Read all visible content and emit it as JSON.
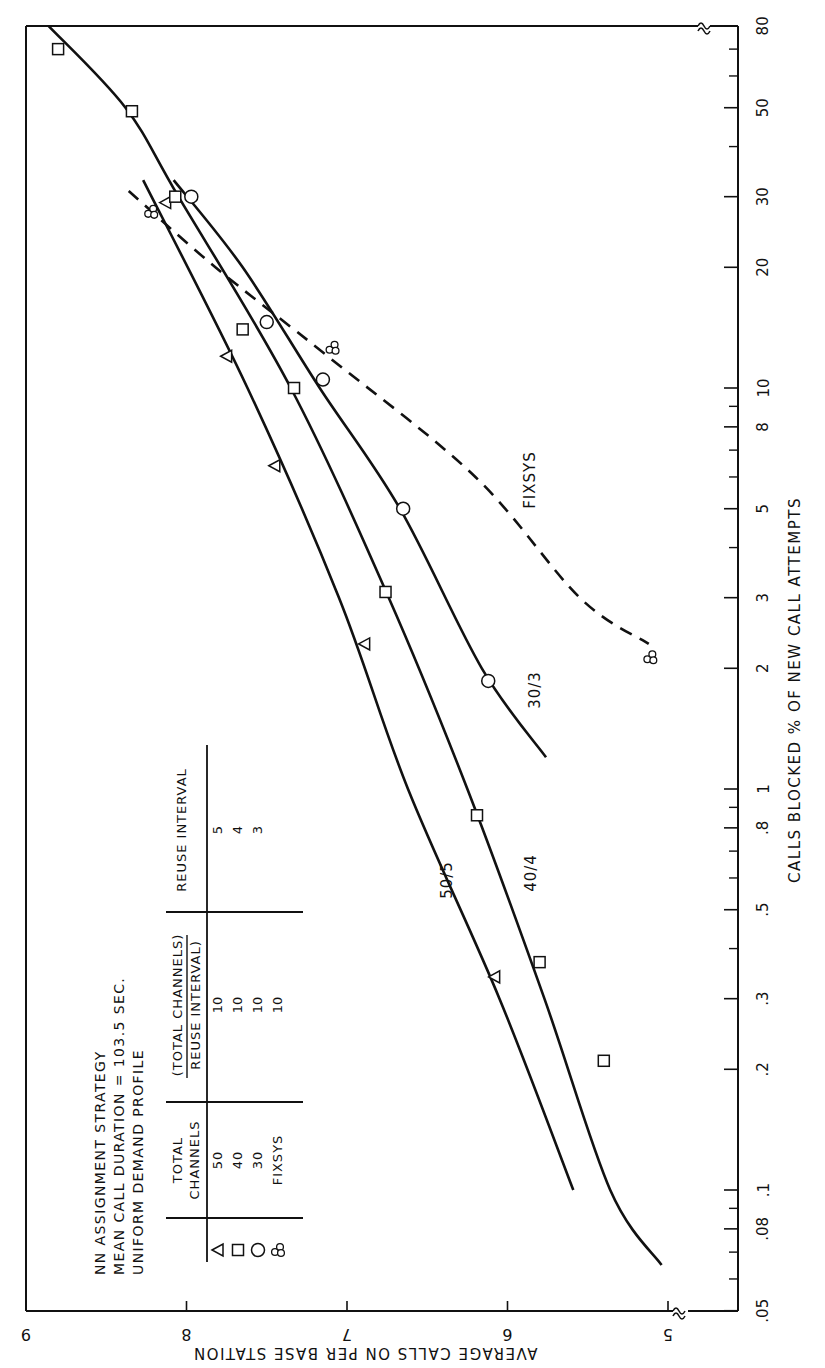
{
  "chart_data": {
    "type": "scatter",
    "orientation_note": "page rotated 90 degrees clockwise",
    "title_lines": [
      "NN ASSIGNMENT STRATEGY",
      "MEAN CALL DURATION = 103.5 SEC.",
      "UNIFORM DEMAND PROFILE"
    ],
    "xlabel": "CALLS BLOCKED % OF NEW CALL ATTEMPTS",
    "ylabel": "AVERAGE CALLS ON PER BASE STATION",
    "xscale": "log",
    "xlim": [
      0.05,
      80
    ],
    "ylim": [
      5,
      9
    ],
    "x_ticks_labeled": [
      0.05,
      0.08,
      0.1,
      0.2,
      0.3,
      0.5,
      0.8,
      1,
      2,
      3,
      5,
      8,
      10,
      20,
      30,
      50,
      80
    ],
    "x_tick_labels": [
      ".05",
      ".08",
      ".1",
      ".2",
      ".3",
      ".5",
      ".8",
      "1",
      "2",
      "3",
      "5",
      "8",
      "10",
      "20",
      "30",
      "50",
      "80"
    ],
    "x_minor_ticks": [
      0.06,
      0.07,
      0.09,
      0.4,
      0.6,
      0.7,
      0.9,
      4,
      6,
      7,
      9,
      40,
      60,
      70
    ],
    "y_ticks": [
      5,
      6,
      7,
      8,
      9
    ],
    "axis_breaks": "both axes show break marks (≈) near origin",
    "grid": false,
    "legend": {
      "headers": [
        "TOTAL CHANNELS",
        "TOTAL CHANNELS / REUSE INTERVAL",
        "REUSE INTERVAL"
      ],
      "rows": [
        {
          "marker": "triangle",
          "total_channels": "50",
          "ratio": "10",
          "reuse_interval": "5"
        },
        {
          "marker": "square",
          "total_channels": "40",
          "ratio": "10",
          "reuse_interval": "4"
        },
        {
          "marker": "circle",
          "total_channels": "30",
          "ratio": "10",
          "reuse_interval": "3"
        },
        {
          "marker": "triple-circle",
          "total_channels": "FIXSYS",
          "ratio": "10",
          "reuse_interval": ""
        }
      ]
    },
    "series": [
      {
        "name": "50/5",
        "marker": "triangle",
        "line": "solid",
        "points": [
          [
            29,
            8.13
          ],
          [
            12,
            7.75
          ],
          [
            6.4,
            7.45
          ],
          [
            2.3,
            6.89
          ],
          [
            0.34,
            6.08
          ]
        ],
        "curve": [
          [
            33,
            8.27
          ],
          [
            10,
            7.62
          ],
          [
            3,
            7.05
          ],
          [
            1,
            6.62
          ],
          [
            0.3,
            6.05
          ],
          [
            0.1,
            5.59
          ]
        ]
      },
      {
        "name": "40/4",
        "marker": "square",
        "line": "solid",
        "points": [
          [
            70,
            8.8
          ],
          [
            49,
            8.34
          ],
          [
            30,
            8.07
          ],
          [
            14,
            7.65
          ],
          [
            10,
            7.33
          ],
          [
            3.1,
            6.76
          ],
          [
            0.86,
            6.19
          ],
          [
            0.37,
            5.8
          ],
          [
            0.21,
            5.4
          ]
        ],
        "curve": [
          [
            80,
            8.86
          ],
          [
            50,
            8.38
          ],
          [
            30,
            8.05
          ],
          [
            10,
            7.35
          ],
          [
            3,
            6.74
          ],
          [
            1,
            6.25
          ],
          [
            0.3,
            5.77
          ],
          [
            0.1,
            5.36
          ],
          [
            0.065,
            5.04
          ]
        ]
      },
      {
        "name": "30/3",
        "marker": "circle",
        "line": "solid",
        "points": [
          [
            30,
            7.97
          ],
          [
            14.6,
            7.5
          ],
          [
            10.5,
            7.15
          ],
          [
            5.0,
            6.65
          ],
          [
            1.86,
            6.12
          ]
        ],
        "curve": [
          [
            33,
            8.08
          ],
          [
            20,
            7.65
          ],
          [
            10,
            7.17
          ],
          [
            5,
            6.67
          ],
          [
            2,
            6.16
          ],
          [
            1.2,
            5.76
          ]
        ]
      },
      {
        "name": "FIXSYS",
        "marker": "triple-circle",
        "line": "dashed",
        "points": [
          [
            27.5,
            8.22
          ],
          [
            12.6,
            7.09
          ],
          [
            2.13,
            5.11
          ]
        ],
        "curve": [
          [
            31,
            8.36
          ],
          [
            20,
            7.82
          ],
          [
            12,
            7.12
          ],
          [
            6,
            6.2
          ],
          [
            3,
            5.55
          ],
          [
            2.3,
            5.12
          ]
        ]
      }
    ],
    "annotations": [
      {
        "text": "50/5",
        "near": "50/5 curve at ~0.4%"
      },
      {
        "text": "40/4",
        "near": "40/4 curve at ~0.5%"
      },
      {
        "text": "30/3",
        "near": "30/3 curve at ~1.5%"
      },
      {
        "text": "FIXSYS",
        "near": "dashed curve at ~5%"
      }
    ]
  }
}
